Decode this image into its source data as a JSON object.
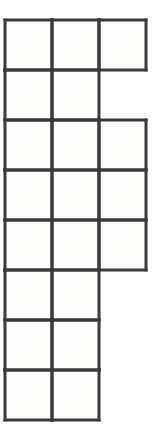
{
  "figure": {
    "kind": "polyomino-grid-diagram",
    "background_color": "#ffffff",
    "cell_fill_color": "#fdfdfc",
    "line_color": "#3a3a3a",
    "line_width": 3,
    "origin_x": 5,
    "origin_y": 20,
    "cell_width": 47,
    "cell_height": 50,
    "rows": 8,
    "columns": 3,
    "total_cells": 20,
    "row_labels": [
      "1",
      "2",
      "3",
      "4",
      "5",
      "6",
      "7",
      "8"
    ],
    "column_labels": [
      "1",
      "2",
      "3"
    ],
    "filled": [
      [
        true,
        true,
        true
      ],
      [
        true,
        true,
        false
      ],
      [
        true,
        true,
        true
      ],
      [
        true,
        true,
        true
      ],
      [
        true,
        true,
        true
      ],
      [
        true,
        true,
        false
      ],
      [
        true,
        true,
        false
      ],
      [
        true,
        true,
        false
      ]
    ],
    "row_cell_counts": [
      3,
      2,
      3,
      3,
      3,
      2,
      2,
      2
    ],
    "column_cell_counts": [
      8,
      8,
      4
    ]
  }
}
